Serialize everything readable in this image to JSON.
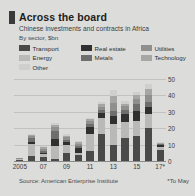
{
  "header": {
    "title": "Across the board",
    "subtitle": "Chinese investments and contracts in Africa",
    "units": "By sector, $bn",
    "marker_color": "#3a3a3a"
  },
  "footer": {
    "source": "Source: American Enterprise Institute",
    "footnote": "*To May"
  },
  "chart_data": {
    "type": "bar",
    "stacked": true,
    "title": "Across the board",
    "subtitle": "Chinese investments and contracts in Africa",
    "xlabel": "",
    "ylabel": "By sector, $bn",
    "ylim": [
      0,
      50
    ],
    "yticks": [
      0,
      10,
      20,
      30,
      40,
      50
    ],
    "ytick_labels": [
      "0",
      "10",
      "20",
      "30",
      "40",
      "50"
    ],
    "axis_position": "right",
    "grid": true,
    "legend_position": "top",
    "categories": [
      "2005",
      "2006",
      "2007",
      "2008",
      "2009",
      "2010",
      "2011",
      "2012",
      "2013",
      "2014",
      "2015",
      "2016",
      "2017"
    ],
    "tick_labels": [
      "2005",
      "07",
      "09",
      "11",
      "13",
      "15",
      "17*"
    ],
    "tick_label_indices": [
      0,
      2,
      4,
      6,
      8,
      10,
      12
    ],
    "series": [
      {
        "name": "Transport",
        "color": "#4a4a4a",
        "values": [
          0.6,
          3.0,
          2.6,
          1.5,
          4.6,
          3.4,
          6.3,
          16.2,
          10.0,
          14.3,
          15.5,
          20.0,
          6.8
        ]
      },
      {
        "name": "Energy",
        "color": "#b9b9b7",
        "values": [
          0.5,
          7.2,
          1.6,
          7.6,
          5.3,
          1.4,
          10.4,
          9.8,
          12.6,
          9.6,
          9.2,
          8.8,
          2.0
        ]
      },
      {
        "name": "Real estate",
        "color": "#303030",
        "values": [
          0.2,
          1.6,
          0.8,
          4.4,
          1.6,
          3.0,
          4.0,
          3.2,
          4.8,
          4.6,
          5.6,
          4.2,
          0.8
        ]
      },
      {
        "name": "Metals",
        "color": "#6e6e6e",
        "values": [
          0.2,
          2.0,
          1.2,
          5.0,
          1.4,
          1.6,
          2.0,
          2.2,
          3.0,
          2.8,
          4.2,
          3.0,
          0.6
        ]
      },
      {
        "name": "Utilities",
        "color": "#8f8f8d",
        "values": [
          0.2,
          1.2,
          1.4,
          2.2,
          1.6,
          1.2,
          1.6,
          1.8,
          5.0,
          2.2,
          3.4,
          4.4,
          0.5
        ]
      },
      {
        "name": "Technology",
        "color": "#a6a6a4",
        "values": [
          0.1,
          0.8,
          1.0,
          1.2,
          1.0,
          0.8,
          1.2,
          1.4,
          4.2,
          1.6,
          2.4,
          3.4,
          0.4
        ]
      },
      {
        "name": "Other",
        "color": "#cfcfcd",
        "values": [
          0.2,
          0.7,
          0.9,
          1.1,
          0.9,
          0.6,
          1.0,
          1.2,
          3.8,
          1.4,
          1.9,
          3.2,
          0.4
        ]
      }
    ],
    "totals": [
      2.0,
      16.5,
      9.5,
      23.0,
      16.4,
      12.0,
      26.5,
      35.8,
      43.4,
      36.5,
      42.2,
      47.0,
      11.5
    ],
    "annotations": [
      "*To May"
    ]
  },
  "legend": {
    "items": [
      {
        "label": "Transport",
        "color": "#4a4a4a",
        "w": "lg-w0"
      },
      {
        "label": "Real estate",
        "color": "#303030",
        "w": "lg-w1"
      },
      {
        "label": "Utilities",
        "color": "#8f8f8d",
        "w": "lg-w2"
      },
      {
        "label": "Energy",
        "color": "#b9b9b7",
        "w": "lg-w0"
      },
      {
        "label": "Metals",
        "color": "#6e6e6e",
        "w": "lg-w1"
      },
      {
        "label": "Technology",
        "color": "#a6a6a4",
        "w": "lg-w2"
      },
      {
        "label": "Other",
        "color": "#cfcfcd",
        "w": "lg-w0"
      }
    ]
  }
}
